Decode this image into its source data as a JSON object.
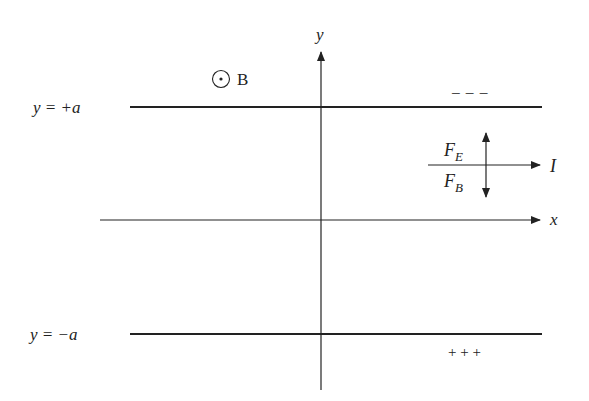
{
  "diagram": {
    "axes": {
      "x_label": "x",
      "y_label": "y"
    },
    "plates": {
      "top": {
        "label": "y = +a",
        "charge": "− − −"
      },
      "bottom": {
        "label": "y = −a",
        "charge": "+ + +"
      }
    },
    "field": {
      "symbol": "⊙",
      "label": "B"
    },
    "current": {
      "label": "I"
    },
    "forces": {
      "electric": {
        "main": "F",
        "sub": "E"
      },
      "magnetic": {
        "main": "F",
        "sub": "B"
      }
    },
    "colors": {
      "ink": "#222222",
      "background": "#ffffff"
    }
  }
}
